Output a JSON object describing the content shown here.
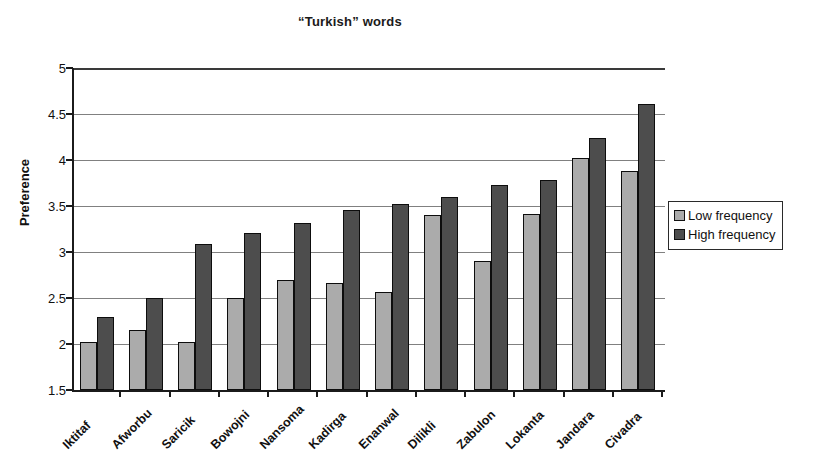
{
  "chart_data": {
    "type": "bar",
    "title": "“Turkish” words",
    "xlabel": "",
    "ylabel": "Preference",
    "ylim": [
      1.5,
      5
    ],
    "ytick_step": 0.5,
    "yticks": [
      "5",
      "4.5",
      "4",
      "3.5",
      "3",
      "2.5",
      "2",
      "1.5"
    ],
    "grid": true,
    "legend_position": "right",
    "categories": [
      "Iktitaf",
      "Afworbu",
      "Saricik",
      "Bowojni",
      "Nansoma",
      "Kadirga",
      "Enanwal",
      "Dilikli",
      "Zabulon",
      "Lokanta",
      "Jandara",
      "Civadra"
    ],
    "series": [
      {
        "name": "Low frequency",
        "color": "#ababab",
        "values": [
          2.02,
          2.15,
          2.02,
          2.5,
          2.7,
          2.66,
          2.57,
          3.4,
          2.9,
          3.41,
          4.02,
          3.88
        ]
      },
      {
        "name": "High frequency",
        "color": "#4d4d4d",
        "values": [
          2.29,
          2.5,
          3.09,
          3.21,
          3.31,
          3.46,
          3.52,
          3.6,
          3.73,
          3.78,
          4.24,
          4.61
        ]
      }
    ]
  },
  "legend": {
    "items": [
      {
        "label": "Low frequency",
        "swatch": "low"
      },
      {
        "label": "High frequency",
        "swatch": "high"
      }
    ]
  }
}
